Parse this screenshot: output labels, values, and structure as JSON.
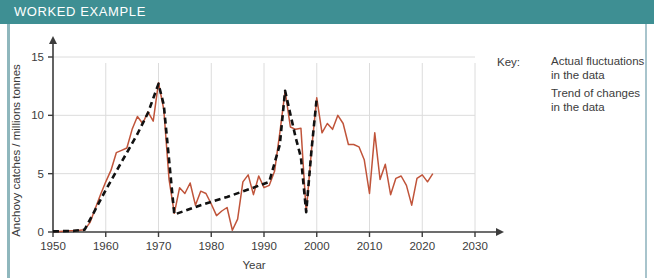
{
  "header": {
    "title": "WORKED EXAMPLE",
    "background_color": "#3e8f93",
    "text_color": "#ffffff"
  },
  "legend": {
    "key_label": "Key:",
    "entries": [
      {
        "style": "solid",
        "color": "#c0543a",
        "line1": "Actual fluctuations",
        "line2": "in the data"
      },
      {
        "style": "dashed",
        "color": "#111111",
        "line1": "Trend of changes",
        "line2": "in the data"
      }
    ]
  },
  "chart_data": {
    "type": "line",
    "title": "",
    "xlabel": "Year",
    "ylabel": "Anchovy catches / millions tonnes",
    "xlim": [
      1950,
      2030
    ],
    "ylim": [
      0,
      15
    ],
    "xticks": [
      1950,
      1960,
      1970,
      1980,
      1990,
      2000,
      2010,
      2020,
      2030
    ],
    "yticks": [
      0,
      5,
      10,
      15
    ],
    "grid": true,
    "legend_position": "right",
    "series": [
      {
        "name": "Actual fluctuations in the data",
        "style": "solid",
        "color": "#c0543a",
        "x": [
          1950,
          1951,
          1952,
          1953,
          1954,
          1955,
          1956,
          1957,
          1958,
          1959,
          1960,
          1961,
          1962,
          1963,
          1964,
          1965,
          1966,
          1967,
          1968,
          1969,
          1970,
          1971,
          1972,
          1973,
          1974,
          1975,
          1976,
          1977,
          1978,
          1979,
          1980,
          1981,
          1982,
          1983,
          1984,
          1985,
          1986,
          1987,
          1988,
          1989,
          1990,
          1991,
          1992,
          1993,
          1994,
          1995,
          1996,
          1997,
          1998,
          1999,
          2000,
          2001,
          2002,
          2003,
          2004,
          2005,
          2006,
          2007,
          2008,
          2009,
          2010,
          2011,
          2012,
          2013,
          2014,
          2015,
          2016,
          2017,
          2018,
          2019,
          2020,
          2021,
          2022
        ],
        "y": [
          0.05,
          0.05,
          0.07,
          0.1,
          0.12,
          0.15,
          0.2,
          0.8,
          2.0,
          3.2,
          4.3,
          5.3,
          6.8,
          7.0,
          7.2,
          8.8,
          9.9,
          9.3,
          10.3,
          9.5,
          12.8,
          10.5,
          4.5,
          1.6,
          3.8,
          3.3,
          4.2,
          2.3,
          3.5,
          3.3,
          2.4,
          1.4,
          1.8,
          2.1,
          0.15,
          1.1,
          4.3,
          4.9,
          3.2,
          4.8,
          3.8,
          4.0,
          5.2,
          8.5,
          12.1,
          9.0,
          8.8,
          8.9,
          1.7,
          7.0,
          11.5,
          8.5,
          9.3,
          8.8,
          10.0,
          9.3,
          7.5,
          7.5,
          7.3,
          6.2,
          3.3,
          8.5,
          4.5,
          5.8,
          3.2,
          4.6,
          4.8,
          4.0,
          2.3,
          4.6,
          4.9,
          4.3,
          5.0
        ]
      },
      {
        "name": "Trend of changes in the data",
        "style": "dashed",
        "color": "#111111",
        "x": [
          1950,
          1954,
          1956,
          1958,
          1960,
          1963,
          1966,
          1968,
          1970,
          1971,
          1973,
          1978,
          1983,
          1988,
          1991,
          1993,
          1994,
          1996,
          1997,
          1998,
          1999,
          2000
        ],
        "y": [
          0.05,
          0.1,
          0.2,
          1.9,
          3.6,
          6.0,
          8.4,
          10.2,
          12.7,
          10.9,
          1.5,
          2.3,
          3.0,
          3.8,
          4.3,
          7.5,
          12.1,
          8.1,
          6.4,
          1.7,
          7.0,
          11.5
        ]
      }
    ]
  }
}
